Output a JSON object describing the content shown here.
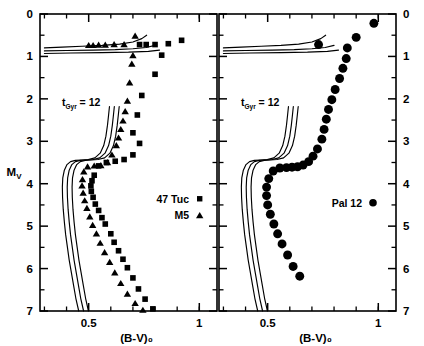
{
  "figure": {
    "background": "#ffffff",
    "ink": "#000000",
    "width": 424,
    "height": 346
  },
  "chart_data": {
    "type": "scatter",
    "title": "",
    "xlabel": "(B-V)₀",
    "ylabel": "Mᵥ",
    "xlim": [
      0.28,
      1.08
    ],
    "ylim": [
      7,
      0
    ],
    "y_inverted": true,
    "grid": false,
    "xticks_major": [
      0.5,
      1
    ],
    "xticklabels": [
      "0.5",
      "1"
    ],
    "xticks_minor": [
      0.3,
      0.4,
      0.6,
      0.7,
      0.8,
      0.9,
      1.0
    ],
    "yticks_major": [
      0,
      1,
      2,
      3,
      4,
      5,
      6,
      7
    ],
    "yticklabels": [
      "0",
      "1",
      "2",
      "3",
      "4",
      "5",
      "6",
      "7"
    ],
    "yticks_minor": [
      0.5,
      1.5,
      2.5,
      3.5,
      4.5,
      5.5,
      6.5
    ],
    "panels": [
      {
        "id": "left",
        "annotation": "t",
        "annotation_sub": "Gyr",
        "annotation_value": "=  12",
        "legend_position": "lower-right",
        "legend": [
          {
            "label": "47 Tuc",
            "marker": "square"
          },
          {
            "label": "M5",
            "marker": "triangle"
          }
        ],
        "series": [
          {
            "name": "47 Tuc",
            "marker": "square",
            "points": [
              [
                0.92,
                0.62
              ],
              [
                0.86,
                0.7
              ],
              [
                0.8,
                0.72
              ],
              [
                0.76,
                0.72
              ],
              [
                0.73,
                0.72
              ],
              [
                0.83,
                0.97
              ],
              [
                0.8,
                1.42
              ],
              [
                0.74,
                1.92
              ],
              [
                0.72,
                2.38
              ],
              [
                0.7,
                2.8
              ],
              [
                0.73,
                3.05
              ],
              [
                0.7,
                3.32
              ],
              [
                0.66,
                3.43
              ],
              [
                0.62,
                3.47
              ],
              [
                0.58,
                3.5
              ],
              [
                0.545,
                3.58
              ],
              [
                0.525,
                3.8
              ],
              [
                0.515,
                3.93
              ],
              [
                0.51,
                4.05
              ],
              [
                0.512,
                4.18
              ],
              [
                0.52,
                4.32
              ],
              [
                0.53,
                4.48
              ],
              [
                0.545,
                4.63
              ],
              [
                0.56,
                4.8
              ],
              [
                0.575,
                4.95
              ],
              [
                0.6,
                5.18
              ],
              [
                0.615,
                5.38
              ],
              [
                0.635,
                5.58
              ],
              [
                0.655,
                5.78
              ],
              [
                0.675,
                5.98
              ],
              [
                0.7,
                6.22
              ],
              [
                0.725,
                6.48
              ],
              [
                0.755,
                6.72
              ],
              [
                0.79,
                6.95
              ]
            ]
          },
          {
            "name": "M5",
            "marker": "triangle",
            "points": [
              [
                0.71,
                0.52
              ],
              [
                0.66,
                0.72
              ],
              [
                0.615,
                0.72
              ],
              [
                0.575,
                0.73
              ],
              [
                0.545,
                0.73
              ],
              [
                0.52,
                0.74
              ],
              [
                0.5,
                0.74
              ],
              [
                0.7,
                0.98
              ],
              [
                0.695,
                1.18
              ],
              [
                0.685,
                1.62
              ],
              [
                0.675,
                2.05
              ],
              [
                0.665,
                2.3
              ],
              [
                0.655,
                2.52
              ],
              [
                0.645,
                2.72
              ],
              [
                0.635,
                2.92
              ],
              [
                0.625,
                3.1
              ],
              [
                0.605,
                3.32
              ],
              [
                0.585,
                3.5
              ],
              [
                0.555,
                3.57
              ],
              [
                0.525,
                3.58
              ],
              [
                0.495,
                3.6
              ],
              [
                0.478,
                3.72
              ],
              [
                0.472,
                3.9
              ],
              [
                0.47,
                4.05
              ],
              [
                0.475,
                4.22
              ],
              [
                0.482,
                4.4
              ],
              [
                0.492,
                4.58
              ],
              [
                0.505,
                4.78
              ],
              [
                0.518,
                4.98
              ],
              [
                0.535,
                5.18
              ],
              [
                0.552,
                5.4
              ],
              [
                0.572,
                5.62
              ],
              [
                0.595,
                5.85
              ],
              [
                0.618,
                6.1
              ],
              [
                0.645,
                6.35
              ],
              [
                0.675,
                6.6
              ],
              [
                0.71,
                6.82
              ],
              [
                0.745,
                6.98
              ]
            ]
          }
        ],
        "isochrone_count": 3
      },
      {
        "id": "right",
        "annotation": "t",
        "annotation_sub": "Gyr",
        "annotation_value": "=  12",
        "legend_position": "middle-right",
        "legend": [
          {
            "label": "Pal 12",
            "marker": "circle"
          }
        ],
        "series": [
          {
            "name": "Pal 12",
            "marker": "circle",
            "points": [
              [
                0.98,
                0.22
              ],
              [
                0.9,
                0.55
              ],
              [
                0.86,
                0.8
              ],
              [
                0.73,
                0.72
              ],
              [
                0.855,
                1.05
              ],
              [
                0.84,
                1.28
              ],
              [
                0.825,
                1.52
              ],
              [
                0.805,
                1.78
              ],
              [
                0.79,
                2.02
              ],
              [
                0.775,
                2.25
              ],
              [
                0.765,
                2.48
              ],
              [
                0.755,
                2.72
              ],
              [
                0.745,
                2.95
              ],
              [
                0.725,
                3.18
              ],
              [
                0.705,
                3.35
              ],
              [
                0.685,
                3.48
              ],
              [
                0.66,
                3.56
              ],
              [
                0.635,
                3.6
              ],
              [
                0.61,
                3.61
              ],
              [
                0.585,
                3.62
              ],
              [
                0.555,
                3.63
              ],
              [
                0.525,
                3.7
              ],
              [
                0.505,
                3.88
              ],
              [
                0.495,
                4.08
              ],
              [
                0.495,
                4.28
              ],
              [
                0.5,
                4.5
              ],
              [
                0.512,
                4.72
              ],
              [
                0.528,
                4.95
              ],
              [
                0.545,
                5.18
              ],
              [
                0.565,
                5.42
              ],
              [
                0.59,
                5.68
              ],
              [
                0.615,
                5.95
              ],
              [
                0.645,
                6.18
              ]
            ]
          }
        ],
        "isochrone_count": 3
      }
    ]
  }
}
